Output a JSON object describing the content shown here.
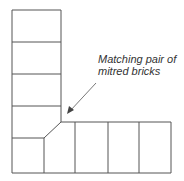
{
  "annotation": {
    "line1": "Matching pair of",
    "line2": "mitred bricks"
  },
  "colors": {
    "line": "#555555",
    "text": "#333333",
    "background": "#ffffff"
  }
}
